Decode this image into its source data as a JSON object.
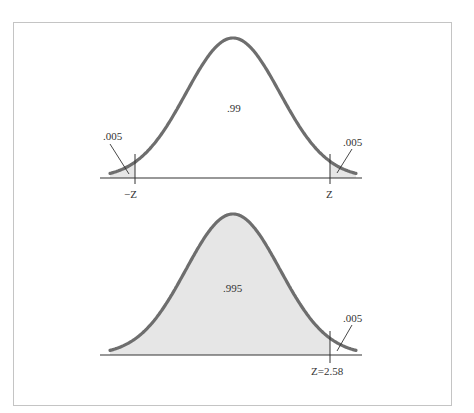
{
  "figure": {
    "colors": {
      "curve": "#6e6e6e",
      "fill": "#e6e6e6",
      "axis": "#333333",
      "frame": "#c4c4c4",
      "text": "#333333"
    },
    "panels": [
      {
        "id": "two-tailed",
        "center_area_label": ".99",
        "left_tail_label": ".005",
        "right_tail_label": ".005",
        "left_critical_label": "−Z",
        "right_critical_label": "Z",
        "geometry": {
          "peak_x": 233,
          "peak_y": 42,
          "baseline_y": 178,
          "axis_x0": 100,
          "axis_x1": 362,
          "curve_x0": 110,
          "curve_x1": 356,
          "sigma_px": 47,
          "left_tick_x": 135,
          "right_tick_x": 330,
          "shade": "tails"
        }
      },
      {
        "id": "one-tailed",
        "center_area_label": ".995",
        "right_tail_label": ".005",
        "right_critical_label": "Z=2.58",
        "geometry": {
          "peak_x": 233,
          "peak_y": 218,
          "baseline_y": 355,
          "axis_x0": 100,
          "axis_x1": 362,
          "curve_x0": 110,
          "curve_x1": 356,
          "sigma_px": 47,
          "right_tick_x": 330,
          "shade": "body"
        }
      }
    ]
  },
  "chart_data": {
    "type": "area",
    "title": "",
    "panels": [
      {
        "name": "two-tailed",
        "regions": [
          {
            "label": ".005",
            "from": "-inf",
            "to": "-Z"
          },
          {
            "label": ".99",
            "from": "-Z",
            "to": "Z"
          },
          {
            "label": ".005",
            "from": "Z",
            "to": "+inf"
          }
        ],
        "critical_values": [
          "-Z",
          "Z"
        ]
      },
      {
        "name": "one-tailed",
        "regions": [
          {
            "label": ".995",
            "from": "-inf",
            "to": "2.58"
          },
          {
            "label": ".005",
            "from": "2.58",
            "to": "+inf"
          }
        ],
        "critical_values": [
          "Z=2.58"
        ]
      }
    ]
  }
}
